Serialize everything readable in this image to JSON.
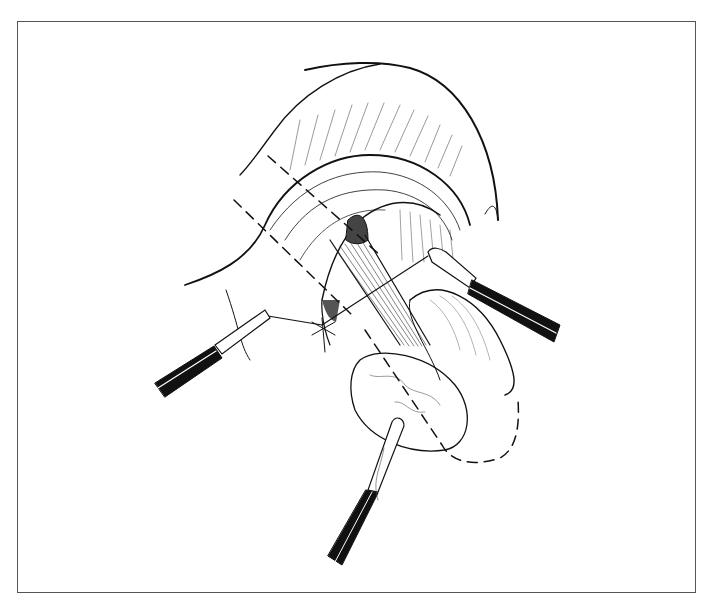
{
  "figure": {
    "type": "surgical line illustration",
    "caption": "",
    "frame": {
      "border_color": "#555555",
      "background": "#ffffff"
    },
    "colors": {
      "ink": "#111111",
      "hatch": "#333333",
      "light": "#777777"
    },
    "elements": [
      {
        "name": "tissue-dome",
        "description": "large curved tissue flap at top"
      },
      {
        "name": "muscle-band",
        "description": "striated curved band of tissue"
      },
      {
        "name": "exposed-structure",
        "description": "striated tubular structure passing through center"
      },
      {
        "name": "incision-lines",
        "description": "dashed guide lines"
      },
      {
        "name": "left-forceps",
        "description": "instrument from lower left holding suture"
      },
      {
        "name": "right-forceps",
        "description": "instrument from right holding suture"
      },
      {
        "name": "bottom-forceps",
        "description": "instrument from bottom grasping sac"
      },
      {
        "name": "suture",
        "description": "thread spanning between forceps"
      },
      {
        "name": "oval-sac",
        "description": "rounded sac at lower center with dashed outline"
      }
    ]
  }
}
